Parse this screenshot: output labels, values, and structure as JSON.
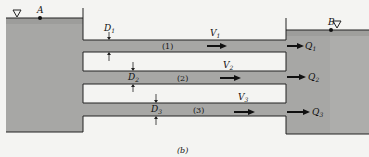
{
  "figure": {
    "caption": "(b)",
    "colors": {
      "water": "#a7a7a5",
      "water_dark": "#979795",
      "background": "#f4f4f2",
      "line": "#222222"
    },
    "reservoirs": [
      {
        "point": "A",
        "side": "left",
        "surface_symbol": "▽"
      },
      {
        "point": "B",
        "side": "right",
        "surface_symbol": "▽"
      }
    ],
    "pipes": [
      {
        "id": "(1)",
        "diameter": "D",
        "diameter_sub": "1",
        "velocity": "V",
        "velocity_sub": "1",
        "flow": "Q",
        "flow_sub": "1"
      },
      {
        "id": "(2)",
        "diameter": "D",
        "diameter_sub": "2",
        "velocity": "V",
        "velocity_sub": "2",
        "flow": "Q",
        "flow_sub": "2"
      },
      {
        "id": "(3)",
        "diameter": "D",
        "diameter_sub": "3",
        "velocity": "V",
        "velocity_sub": "3",
        "flow": "Q",
        "flow_sub": "3"
      }
    ]
  }
}
